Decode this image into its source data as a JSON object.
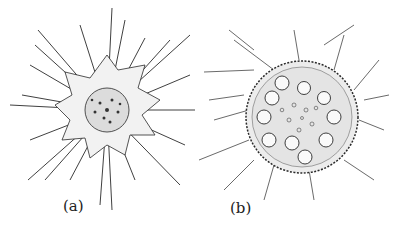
{
  "figure": {
    "panels": [
      {
        "id": "a",
        "label": "(a)",
        "subject": "radiating spiny organism with dense central core"
      },
      {
        "id": "b",
        "label": "(b)",
        "subject": "spherical organism with inner vacuoles and bristly outer spines"
      }
    ],
    "colors": {
      "ink": "#2a2a2a",
      "background": "#ffffff"
    }
  }
}
